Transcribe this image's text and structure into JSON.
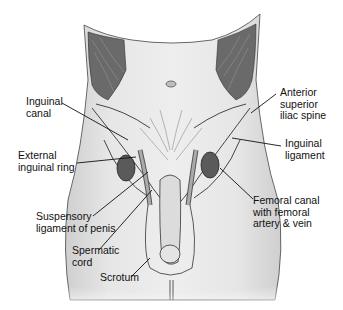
{
  "diagram": {
    "labels": [
      {
        "id": "inguinal-canal",
        "lines": [
          "Inguinal",
          "canal"
        ],
        "x": 26,
        "y": 96
      },
      {
        "id": "external-inguinal-ring",
        "lines": [
          "External",
          "inguinal ring"
        ],
        "x": 18,
        "y": 150
      },
      {
        "id": "suspensory-ligament",
        "lines": [
          "Suspensory",
          "ligament of penis"
        ],
        "x": 36,
        "y": 211
      },
      {
        "id": "spermatic-cord",
        "lines": [
          "Spermatic",
          "cord"
        ],
        "x": 72,
        "y": 245
      },
      {
        "id": "scrotum",
        "lines": [
          "Scrotum"
        ],
        "x": 100,
        "y": 272
      },
      {
        "id": "anterior-superior-iliac-spine",
        "lines": [
          "Anterior",
          "superior",
          "iliac spine"
        ],
        "x": 280,
        "y": 87
      },
      {
        "id": "inguinal-ligament",
        "lines": [
          "Inguinal",
          "ligament"
        ],
        "x": 285,
        "y": 138
      },
      {
        "id": "femoral-canal",
        "lines": [
          "Femoral canal",
          "with femoral",
          "artery & vein"
        ],
        "x": 253,
        "y": 195
      }
    ],
    "colors": {
      "skin": "#e8e8e8",
      "muscle": "#6a6a6a",
      "outline": "#333333",
      "leader": "#111111"
    }
  }
}
